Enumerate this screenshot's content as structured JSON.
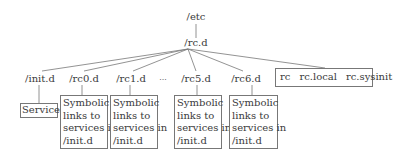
{
  "root": {
    "label": "/etc"
  },
  "child": {
    "label": "/rc.d"
  },
  "dirs": [
    {
      "label": "/init.d"
    },
    {
      "label": "/rc0.d"
    },
    {
      "label": "/rc1.d"
    },
    {
      "label": "..."
    },
    {
      "label": "/rc5.d"
    },
    {
      "label": "/rc6.d"
    }
  ],
  "files": [
    "rc",
    "rc.local",
    "rc.sysinit"
  ],
  "services_box": {
    "label": "Services"
  },
  "symlink_box": {
    "lines": [
      "Symbolic",
      "links to",
      "services in",
      "/init.d"
    ]
  },
  "colors": {
    "line": "#777777",
    "text": "#3a3a3a"
  }
}
